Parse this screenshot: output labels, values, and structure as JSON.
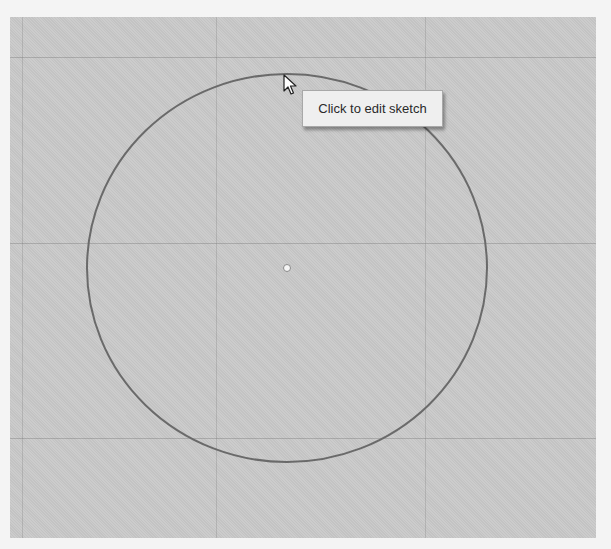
{
  "viewport": {
    "background": "#c9c9c9",
    "grid_color": "#6e6e6e"
  },
  "sketch": {
    "shape": "circle",
    "center": {
      "x": 287,
      "y": 268
    },
    "radius_x": 200,
    "radius_y": 194,
    "stroke_color": "#6a6a6a",
    "center_point_color": "#f5f5f5"
  },
  "tooltip": {
    "text": "Click to edit sketch"
  },
  "cursor": {
    "icon": "arrow-pointer-icon",
    "x": 283,
    "y": 74
  }
}
